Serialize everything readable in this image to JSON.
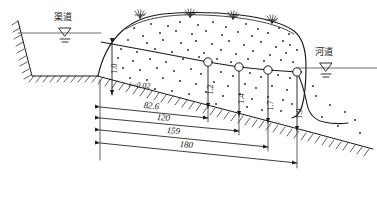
{
  "figure": {
    "type": "engineering-cross-section",
    "title": "",
    "background": "#ffffff",
    "line_color": "#1a1a1a",
    "width": 377,
    "height": 211
  },
  "labels": {
    "left_water_body": "渠道",
    "right_water_body": "河道",
    "slope": "i=0.02"
  },
  "icons": {
    "water_surface": "water-level-triangle",
    "grass": "grass-tuft",
    "hatch": "ground-hatching",
    "node": "observation-well-circle"
  },
  "depths": [
    {
      "id": "d0",
      "value": "1.0",
      "x": 112,
      "top": 50,
      "bottom": 95
    },
    {
      "id": "d1",
      "value": "1.2",
      "x": 208,
      "top": 64,
      "bottom": 108
    },
    {
      "id": "d2",
      "value": "1.4",
      "x": 239,
      "top": 69,
      "bottom": 116
    },
    {
      "id": "d3",
      "value": "1.7",
      "x": 268,
      "top": 72,
      "bottom": 123
    },
    {
      "id": "d4",
      "value": "1.9",
      "x": 297,
      "top": 74,
      "bottom": 131
    }
  ],
  "dimensions": [
    {
      "id": "m0",
      "value": "82.6",
      "x1": 100,
      "y1": 107,
      "x2": 208,
      "y2": 118
    },
    {
      "id": "m1",
      "value": "120",
      "x1": 100,
      "y1": 118,
      "x2": 239,
      "y2": 131
    },
    {
      "id": "m2",
      "value": "159",
      "x1": 100,
      "y1": 130,
      "x2": 268,
      "y2": 147
    },
    {
      "id": "m3",
      "value": "180",
      "x1": 100,
      "y1": 143,
      "x2": 297,
      "y2": 163
    }
  ],
  "nodes": [
    {
      "id": "n1",
      "cx": 208,
      "cy": 62
    },
    {
      "id": "n2",
      "cx": 239,
      "cy": 67
    },
    {
      "id": "n3",
      "cx": 268,
      "cy": 70
    },
    {
      "id": "n4",
      "cx": 297,
      "cy": 72
    }
  ],
  "grass_marks": [
    {
      "x": 140,
      "y": 16
    },
    {
      "x": 190,
      "y": 15
    },
    {
      "x": 233,
      "y": 17
    },
    {
      "x": 272,
      "y": 21
    }
  ],
  "water_levels": [
    {
      "id": "canal-level",
      "x": 65,
      "y": 32
    },
    {
      "id": "river-level",
      "x": 325,
      "y": 67
    }
  ]
}
